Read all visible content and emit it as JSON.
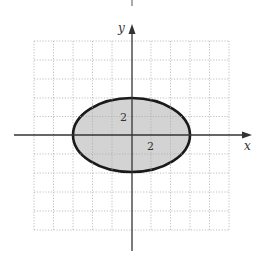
{
  "figure": {
    "type": "ellipse-region-plot",
    "axes": {
      "x_label": "x",
      "y_label": "y"
    },
    "grid": {
      "cells_x": 10,
      "cells_y": 10,
      "x_range": [
        -5,
        5
      ],
      "y_range": [
        -5,
        5
      ],
      "style": "dotted"
    },
    "ellipse": {
      "center": [
        0,
        0
      ],
      "semi_major_x": 3,
      "semi_minor_y": 2,
      "fill": "#d3d3d3",
      "stroke": "#1a1a1a"
    },
    "labels": [
      {
        "text": "2",
        "position": "on y-axis above origin"
      },
      {
        "text": "2",
        "position": "on x-axis right of origin"
      }
    ],
    "colors": {
      "axis": "#333333",
      "grid": "#aaaaaa",
      "region_fill": "#d3d3d3",
      "boundary": "#1a1a1a"
    }
  }
}
